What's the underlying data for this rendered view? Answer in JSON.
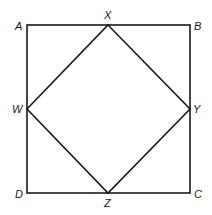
{
  "diagram": {
    "type": "geometry",
    "outer_square": {
      "vertices": [
        "A",
        "B",
        "C",
        "D"
      ]
    },
    "inner_square": {
      "vertices": [
        "X",
        "Y",
        "Z",
        "W"
      ]
    },
    "labels": {
      "A": "A",
      "B": "B",
      "C": "C",
      "D": "D",
      "W": "W",
      "X": "X",
      "Y": "Y",
      "Z": "Z"
    },
    "colors": {
      "stroke": "#1a1a1a",
      "background": "#ffffff"
    }
  }
}
